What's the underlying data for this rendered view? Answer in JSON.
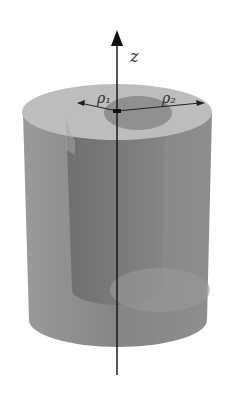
{
  "diagram": {
    "axis_label": "z",
    "inner_radius_label": "ρ₁",
    "outer_radius_label": "ρ₂",
    "colors": {
      "outer_wall": "#8c8c8c",
      "top_face": "#b8b8b8",
      "inner_hole": "#8f8f8f",
      "inner_wall": "#6e6e6e",
      "axis": "#111111"
    }
  }
}
